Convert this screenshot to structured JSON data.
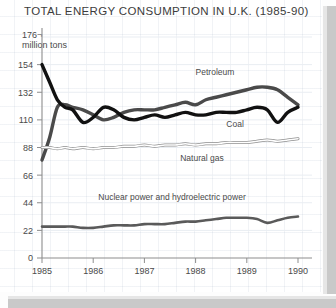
{
  "card": {
    "title": "TOTAL ENERGY CONSUMPTION IN U.K. (1985-90)",
    "axis_top_value": "176",
    "axis_top_tick": "¬",
    "unit_label": "million tons"
  },
  "chart_data": {
    "type": "line",
    "title": "TOTAL ENERGY CONSUMPTION IN U.K. (1985-90)",
    "xlabel": "",
    "ylabel": "million tons",
    "ylim": [
      0,
      176
    ],
    "xlim": [
      1985,
      1990
    ],
    "yticks": [
      0,
      22,
      44,
      66,
      88,
      110,
      132,
      154,
      176
    ],
    "ytick_labels": [
      "0",
      "22",
      "44",
      "66",
      "88",
      "110",
      "132",
      "154",
      "176"
    ],
    "xticks": [
      1985,
      1986,
      1987,
      1988,
      1989,
      1990
    ],
    "xtick_labels": [
      "1985",
      "1986",
      "1987",
      "1988",
      "1989",
      "1990"
    ],
    "grid": true,
    "legend": "inline-annotations",
    "x": [
      1985.0,
      1985.15,
      1985.3,
      1985.45,
      1985.6,
      1985.8,
      1986.0,
      1986.2,
      1986.4,
      1986.6,
      1986.8,
      1987.0,
      1987.2,
      1987.4,
      1987.6,
      1987.8,
      1988.0,
      1988.2,
      1988.4,
      1988.6,
      1988.8,
      1989.0,
      1989.2,
      1989.4,
      1989.6,
      1989.8,
      1990.0
    ],
    "series": [
      {
        "name": "Petroleum",
        "label": "Petroleum",
        "style": "thick-dark-gray",
        "color": "#4a4a4a",
        "values": [
          78,
          96,
          120,
          122,
          120,
          118,
          114,
          110,
          112,
          116,
          118,
          118,
          118,
          120,
          122,
          124,
          122,
          126,
          128,
          130,
          132,
          134,
          136,
          136,
          134,
          128,
          122
        ]
      },
      {
        "name": "Coal",
        "label": "Coal",
        "style": "thick-black",
        "color": "#111111",
        "values": [
          154,
          140,
          126,
          120,
          118,
          108,
          112,
          120,
          118,
          112,
          110,
          112,
          114,
          112,
          114,
          116,
          114,
          114,
          116,
          116,
          116,
          118,
          120,
          118,
          108,
          116,
          120
        ]
      },
      {
        "name": "Natural gas",
        "label": "Natural gas",
        "style": "thin-outline",
        "color": "#9a9a9a",
        "values": [
          88,
          88,
          87,
          88,
          87,
          88,
          87,
          88,
          88,
          89,
          89,
          90,
          89,
          90,
          90,
          91,
          90,
          91,
          91,
          92,
          92,
          92,
          93,
          94,
          93,
          94,
          95
        ]
      },
      {
        "name": "Nuclear power and hydroelectric power",
        "label": "Nuclear power and hydroelectric power",
        "style": "medium-gray",
        "color": "#5a5a5a",
        "values": [
          25,
          25,
          25,
          25,
          25,
          24,
          24,
          25,
          26,
          26,
          26,
          27,
          27,
          27,
          28,
          29,
          29,
          30,
          31,
          32,
          32,
          32,
          31,
          28,
          30,
          32,
          33
        ]
      }
    ],
    "annotations": [
      {
        "text": "Petroleum",
        "x": 1988.0,
        "y": 146
      },
      {
        "text": "Coal",
        "x": 1988.6,
        "y": 104
      },
      {
        "text": "Natural gas",
        "x": 1987.7,
        "y": 77
      },
      {
        "text": "Nuclear power and hydroelectric power",
        "x": 1986.1,
        "y": 46
      }
    ]
  }
}
